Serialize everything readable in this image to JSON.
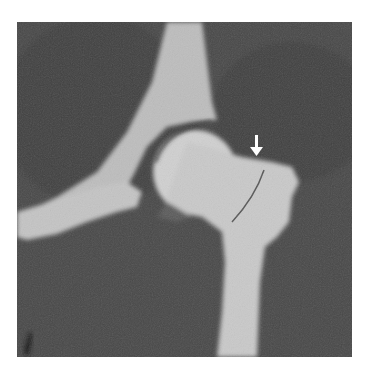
{
  "image": {
    "type": "radiograph",
    "subject": "hip joint coronal view",
    "background_color": "#ffffff",
    "film_color": "#4a4a4a",
    "bone_color": "#c8c8c8",
    "annotation": {
      "icon": "arrow-down-icon",
      "color": "#ffffff",
      "description": "white arrow pointing to fracture line at femoral neck / greater trochanter"
    }
  }
}
